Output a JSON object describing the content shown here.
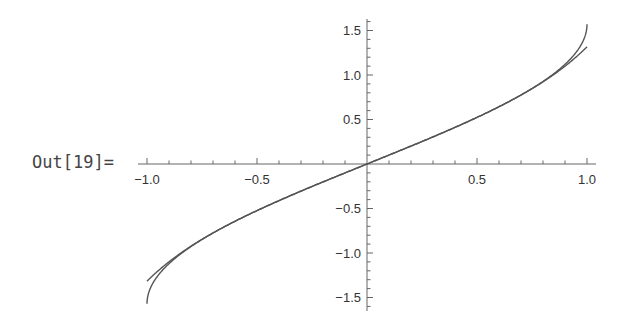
{
  "cell": {
    "output_label": "Out[19]="
  },
  "chart_data": {
    "type": "line",
    "title": "",
    "xlabel": "",
    "ylabel": "",
    "xlim": [
      -1.0,
      1.0
    ],
    "ylim": [
      -1.6,
      1.6
    ],
    "grid": false,
    "legend": null,
    "x_ticks": {
      "major": [
        -1.0,
        -0.5,
        0.5,
        1.0
      ],
      "labels": [
        "−1.0",
        "−0.5",
        "0.5",
        "1.0"
      ],
      "minor_step": 0.1
    },
    "y_ticks": {
      "major": [
        1.5,
        1.0,
        0.5,
        -0.5,
        -1.0,
        -1.5
      ],
      "labels": [
        "1.5",
        "1.0",
        "0.5",
        "−0.5",
        "−1.0",
        "−1.5"
      ],
      "minor_step": 0.1
    },
    "series": [
      {
        "name": "arcsin(x)",
        "x": [
          -1.0,
          -0.9,
          -0.75,
          -0.5,
          -0.25,
          0.0,
          0.25,
          0.5,
          0.75,
          0.9,
          1.0
        ],
        "y": [
          -1.571,
          -1.12,
          -0.848,
          -0.524,
          -0.253,
          0.0,
          0.253,
          0.524,
          0.848,
          1.12,
          1.571
        ]
      },
      {
        "name": "series approximation of arcsin(x)",
        "x": [
          -1.0,
          -0.9,
          -0.75,
          -0.5,
          -0.25,
          0.0,
          0.25,
          0.5,
          0.75,
          0.9,
          1.0
        ],
        "y": [
          -1.317,
          -1.094,
          -0.845,
          -0.524,
          -0.253,
          0.0,
          0.253,
          0.524,
          0.845,
          1.094,
          1.317
        ]
      }
    ],
    "line_color": "#555555"
  },
  "axis_color": "#666666"
}
